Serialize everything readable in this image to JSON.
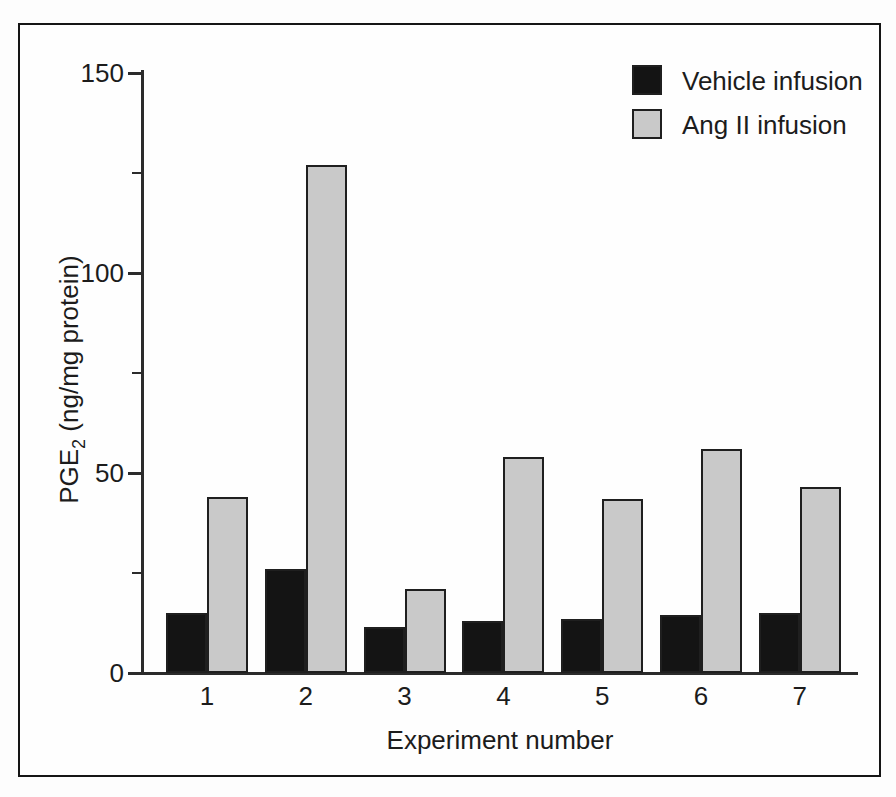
{
  "figure": {
    "frame_color": "#151515",
    "background": "#fefefe",
    "axis_color": "#2b2b2b"
  },
  "chart_data": {
    "type": "bar",
    "title": "",
    "xlabel": "Experiment number",
    "ylabel": "PGE₂ (ng/mg protein)",
    "ylabel_parts": {
      "main": "PGE",
      "sub": "2",
      "rest": " (ng/mg protein)"
    },
    "categories": [
      "1",
      "2",
      "3",
      "4",
      "5",
      "6",
      "7"
    ],
    "series": [
      {
        "name": "Vehicle infusion",
        "color": "#141414",
        "values": [
          15,
          26,
          11.5,
          13,
          13.5,
          14.5,
          15
        ]
      },
      {
        "name": "Ang II infusion",
        "color": "#c9c9c9",
        "values": [
          44,
          127,
          21,
          54,
          43.5,
          56,
          46.5
        ]
      }
    ],
    "ylim": [
      0,
      150
    ],
    "yticks": [
      0,
      50,
      100,
      150
    ],
    "yticks_minor": [
      25,
      75,
      125
    ],
    "grid": false,
    "legend_position": "top-right"
  }
}
